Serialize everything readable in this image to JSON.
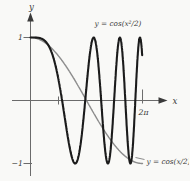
{
  "figure": {
    "background": "#f9f9f7",
    "axis_color": "#6b6b6b",
    "label_color": "#3a3a3a"
  },
  "chart_data": {
    "type": "line",
    "title": "",
    "xlabel": "x",
    "ylabel": "y",
    "grid": false,
    "legend_position": "inline-annotations",
    "xlim": [
      -1.0,
      7.9
    ],
    "ylim": [
      -1.3,
      1.55
    ],
    "x_ticks": [
      {
        "value": 1.5708,
        "label": ""
      },
      {
        "value": 6.2832,
        "label": "2π"
      }
    ],
    "y_ticks": [
      {
        "value": 1,
        "label": "1"
      },
      {
        "value": -1,
        "label": "−1"
      }
    ],
    "series": [
      {
        "name": "y = cos(x²/2)",
        "expression": "cos(x^2/2)",
        "arg": "x^2/2",
        "domain": [
          0,
          6.27
        ],
        "color": "#1b1b1b",
        "width": 2.1,
        "key_points": {
          "start": [
            0,
            1
          ],
          "maxima_x": [
            0,
            3.545,
            5.013,
            6.14
          ],
          "minima_x": [
            2.507,
            4.342,
            5.605
          ],
          "zeros_x": [
            1.772,
            3.07,
            3.963,
            4.685,
            5.317,
            5.87
          ],
          "end": [
            6.27,
            0.69
          ]
        }
      },
      {
        "name": "y = cos(x/2)",
        "expression": "cos(x/2)",
        "arg": "x/2",
        "domain": [
          0,
          6.2832
        ],
        "color": "#8c8c8c",
        "width": 1.4,
        "key_points": {
          "start": [
            0,
            1
          ],
          "zeros_x": [
            3.1416
          ],
          "end": [
            6.2832,
            -1
          ]
        }
      }
    ],
    "annotations": [
      {
        "text": "y = cos(x²/2)",
        "target_series": 0,
        "position": "top-center"
      },
      {
        "text": "y = cos(x/2)",
        "target_series": 1,
        "position": "bottom-right",
        "leader_line": true
      }
    ]
  }
}
